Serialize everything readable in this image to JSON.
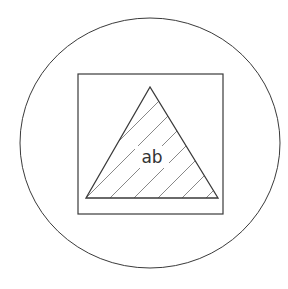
{
  "diagram": {
    "colors": {
      "stroke": "#3a3a3a",
      "background": "#ffffff",
      "hatch": "#6a6a6a"
    },
    "shapes": {
      "circle": {
        "cx": 150,
        "cy": 143,
        "rx": 130,
        "ry": 125
      },
      "square": {
        "x": 78,
        "y": 74,
        "width": 145,
        "height": 140
      },
      "triangle": {
        "points": "150,87 86,198 218,198"
      }
    },
    "label": {
      "text": "ab",
      "x": 152,
      "y": 163
    }
  }
}
